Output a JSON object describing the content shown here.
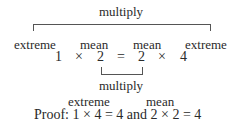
{
  "top": {
    "label": "multiply",
    "terms": [
      "extreme",
      "mean",
      "mean",
      "extreme"
    ]
  },
  "equation": {
    "items": [
      "1",
      "×",
      "2",
      "=",
      "2",
      "×",
      "4"
    ]
  },
  "bottom": {
    "label": "multiply"
  },
  "proof": {
    "labels": [
      "extreme",
      "mean"
    ],
    "text": "Proof: 1 × 4 = 4 and 2 × 2 = 4"
  }
}
